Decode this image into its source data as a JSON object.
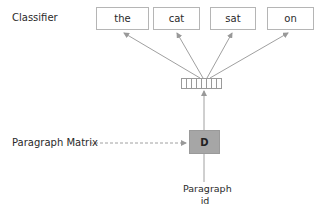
{
  "diagram": {
    "classifier_label": "Classifier",
    "words": [
      "the",
      "cat",
      "sat",
      "on"
    ],
    "vector_cells": 7,
    "paragraph_matrix_label": "Paragraph Matrix",
    "d_label": "D",
    "paragraph_id_label_line1": "Paragraph",
    "paragraph_id_label_line2": "id",
    "colors": {
      "box_border": "#b5b5b5",
      "d_fill": "#a6a6a6",
      "arrow": "#999999"
    }
  }
}
